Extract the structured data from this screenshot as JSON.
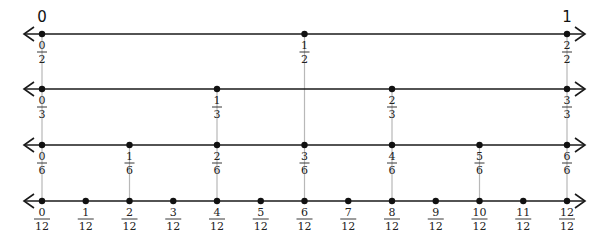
{
  "diagram": {
    "end_labels": {
      "left": "0",
      "right": "1"
    },
    "lines": [
      {
        "name": "halves",
        "denominator": 2,
        "y": 34,
        "points": [
          "0/2",
          "1/2",
          "2/2"
        ]
      },
      {
        "name": "thirds",
        "denominator": 3,
        "y": 89,
        "points": [
          "0/3",
          "1/3",
          "2/3",
          "3/3"
        ]
      },
      {
        "name": "sixths",
        "denominator": 6,
        "y": 145,
        "points": [
          "0/6",
          "1/6",
          "2/6",
          "3/6",
          "4/6",
          "5/6",
          "6/6"
        ]
      },
      {
        "name": "twelfths",
        "denominator": 12,
        "y": 201,
        "points": [
          "0/12",
          "1/12",
          "2/12",
          "3/12",
          "4/12",
          "5/12",
          "6/12",
          "7/12",
          "8/12",
          "9/12",
          "10/12",
          "11/12",
          "12/12"
        ]
      }
    ],
    "guides": [
      {
        "value": "0",
        "from_line": 0,
        "to_line": 3
      },
      {
        "value": "1/6",
        "from_line": 2,
        "to_line": 3
      },
      {
        "value": "1/3",
        "from_line": 1,
        "to_line": 3
      },
      {
        "value": "1/2",
        "from_line": 0,
        "to_line": 3
      },
      {
        "value": "2/3",
        "from_line": 1,
        "to_line": 3
      },
      {
        "value": "5/6",
        "from_line": 2,
        "to_line": 3
      },
      {
        "value": "1",
        "from_line": 0,
        "to_line": 3
      }
    ],
    "colors": {
      "line": "#1a1a1a",
      "guide": "#b8b8b8",
      "point": "#111111",
      "text": "#222222"
    }
  }
}
